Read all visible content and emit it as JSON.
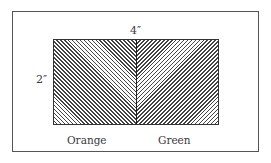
{
  "diagram": {
    "dimensions": {
      "width_label": "4″",
      "height_label": "2″"
    },
    "regions": [
      {
        "name": "Orange",
        "hatch": "diagonal-down-right"
      },
      {
        "name": "Green",
        "hatch": "diagonal-up-right"
      }
    ]
  }
}
